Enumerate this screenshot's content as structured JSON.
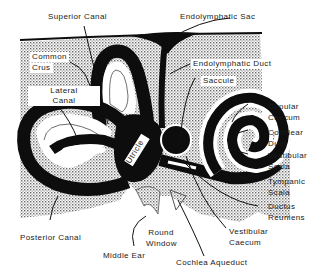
{
  "diagram": {
    "colors": {
      "stipple": "#9a9a9a",
      "black": "#0d0d0d",
      "white": "#ffffff"
    },
    "labels": {
      "superior_canal": "Superior Canal",
      "endolymphatic_sac": "Endolymphatic Sac",
      "common_crus_line1": "Common",
      "common_crus_line2": "Crus",
      "endolymphatic_duct": "Endolymphatic Duct",
      "lateral_canal_line1": "Lateral",
      "lateral_canal_line2": "Canal",
      "saccule": "Saccule",
      "utricle": "Utricle",
      "cupular_caecum_line1": "Cupular",
      "cupular_caecum_line2": "Caecum",
      "cochlear_duct_line1": "Cochlear",
      "cochlear_duct_line2": "Duct",
      "vestibular_scala_line1": "Vestibular",
      "vestibular_scala_line2": "Scala",
      "tympanic_scala_line1": "Tympanic",
      "tympanic_scala_line2": "Scala",
      "ductus_reuniens_line1": "Ductus",
      "ductus_reuniens_line2": "Reuniens",
      "posterior_canal": "Posterior Canal",
      "round_window_line1": "Round",
      "round_window_line2": "Window",
      "middle_ear": "Middle Ear",
      "vestibular_caecum_line1": "Vestibular",
      "vestibular_caecum_line2": "Caecum",
      "cochlea_aqueduct": "Cochlea Aqueduct"
    }
  }
}
